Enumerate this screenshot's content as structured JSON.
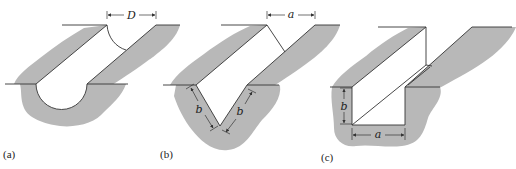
{
  "figure": {
    "colors": {
      "ground": "#b8b8b8",
      "line": "#333333",
      "background": "#ffffff"
    },
    "panels": [
      {
        "id": "a",
        "caption": "(a)",
        "shape": "semicircular channel",
        "dimension_labels": [
          "D"
        ]
      },
      {
        "id": "b",
        "caption": "(b)",
        "shape": "triangular (V) channel",
        "dimension_labels": [
          "a",
          "b",
          "b"
        ]
      },
      {
        "id": "c",
        "caption": "(c)",
        "shape": "rectangular channel",
        "dimension_labels": [
          "a",
          "b"
        ]
      }
    ]
  }
}
